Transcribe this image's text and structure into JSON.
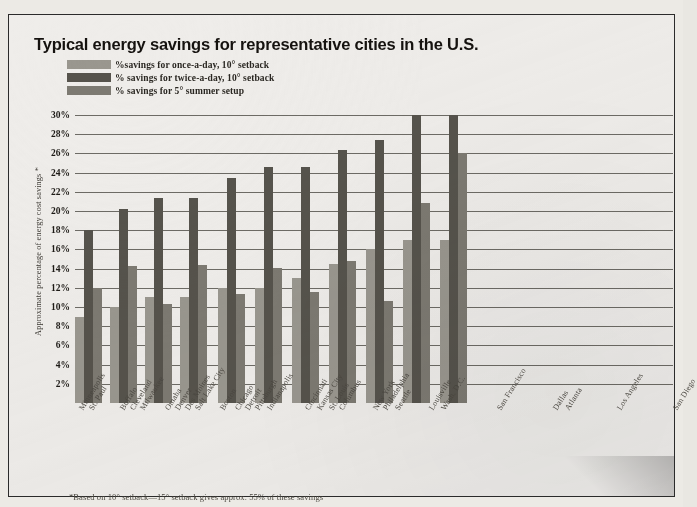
{
  "title": "Typical energy savings for representative cities in the U.S.",
  "footnote": "*Based on 10° setback—15° setback gives approx. 55% of these savings",
  "ylabel": "Approximate percentage of energy cost savings *",
  "legend": [
    {
      "label": "%savings for once-a-day, 10° setback",
      "color": "#9a978f"
    },
    {
      "label": "% savings for twice-a-day, 10° setback",
      "color": "#56534c"
    },
    {
      "label": "% savings for 5° summer setup",
      "color": "#7d7a72"
    }
  ],
  "colors": {
    "series1": "#9a978f",
    "series2": "#56534c",
    "series3": "#7d7a72",
    "grid": "#56534d",
    "text": "#1d1a16",
    "paper": "#efedea",
    "frame": "#2b2b2b"
  },
  "chart_data": {
    "type": "bar",
    "title": "Typical energy savings for representative cities in the U.S.",
    "xlabel": "",
    "ylabel": "Approximate percentage of energy cost savings *",
    "ylim": [
      0,
      30
    ],
    "ytick_labels": [
      "30%",
      "28%",
      "26%",
      "24%",
      "22%",
      "20%",
      "18%",
      "16%",
      "14%",
      "12%",
      "10%",
      "8%",
      "6%",
      "4%",
      "2%"
    ],
    "ytick_values": [
      30,
      28,
      26,
      24,
      22,
      20,
      18,
      16,
      14,
      12,
      10,
      8,
      6,
      4,
      2
    ],
    "grid": true,
    "legend_position": "top-left",
    "groups": [
      {
        "cities": [
          "Minneapolis",
          "St. Paul"
        ]
      },
      {
        "cities": [
          "Buffalo",
          "Cleveland",
          "Milwaukee"
        ]
      },
      {
        "cities": [
          "Omaha",
          "Denver",
          "Des Moines",
          "Salt Lake City"
        ]
      },
      {
        "cities": [
          "Boston",
          "Chicago",
          "Detroit",
          "Pittsburgh",
          "Indianapolis"
        ]
      },
      {
        "cities": [
          "Cincinnati",
          "Kansas City",
          "St. Louis",
          "Columbus"
        ]
      },
      {
        "cities": [
          "New York",
          "Philadelphia",
          "Seattle"
        ]
      },
      {
        "cities": [
          "Louisville",
          "Wash. D.C."
        ]
      },
      {
        "cities": [
          "San Francisco"
        ]
      },
      {
        "cities": [
          "Dallas",
          "Atlanta"
        ]
      },
      {
        "cities": [
          "Los Angeles"
        ]
      },
      {
        "cities": [
          "San Diego"
        ]
      }
    ],
    "categories": [
      "Minneapolis / St. Paul",
      "Buffalo / Cleveland / Milwaukee",
      "Omaha / Denver / Des Moines / Salt Lake City",
      "Boston / Chicago / Detroit / Pittsburgh / Indianapolis",
      "Cincinnati / Kansas City / St. Louis / Columbus",
      "New York / Philadelphia / Seattle",
      "Louisville / Wash. D.C.",
      "San Francisco",
      "Dallas / Atlanta",
      "Los Angeles",
      "San Diego"
    ],
    "series": [
      {
        "name": "% savings for once-a-day, 10° setback",
        "color": "#9a978f",
        "values": [
          9,
          10,
          11,
          11,
          12,
          12,
          13,
          14.5,
          16,
          17,
          17
        ]
      },
      {
        "name": "% savings for twice-a-day, 10° setback",
        "color": "#56534c",
        "values": [
          18,
          20.2,
          21.4,
          21.4,
          23.4,
          24.6,
          24.6,
          26.4,
          27.4,
          30,
          30
        ]
      },
      {
        "name": "% savings for 5° summer setup",
        "color": "#7d7a72",
        "values": [
          12,
          14.3,
          10.3,
          14.4,
          11.4,
          14.1,
          11.6,
          14.8,
          10.6,
          20.8,
          26
        ]
      }
    ]
  },
  "xaxis_labels": [
    {
      "text": "Minneapolis",
      "pos": 1.5
    },
    {
      "text": "St. Paul",
      "pos": 11.5
    },
    {
      "text": "Buffalo",
      "pos": 43
    },
    {
      "text": "Cleveland",
      "pos": 53
    },
    {
      "text": "Milwaukee",
      "pos": 63
    },
    {
      "text": "Omaha",
      "pos": 88
    },
    {
      "text": "Denver",
      "pos": 98
    },
    {
      "text": "Des Moines",
      "pos": 108
    },
    {
      "text": "Salt Lake City",
      "pos": 118
    },
    {
      "text": "Boston",
      "pos": 143
    },
    {
      "text": "Chicago",
      "pos": 158
    },
    {
      "text": "Detroit",
      "pos": 168
    },
    {
      "text": "Pittsburgh",
      "pos": 178
    },
    {
      "text": "Indianapolis",
      "pos": 190
    },
    {
      "text": "Cincinnati",
      "pos": 228
    },
    {
      "text": "Kansas City",
      "pos": 240
    },
    {
      "text": "St. Louis",
      "pos": 252
    },
    {
      "text": "Columbus",
      "pos": 262
    },
    {
      "text": "New York",
      "pos": 296
    },
    {
      "text": "Philadelphia",
      "pos": 306
    },
    {
      "text": "Seattle",
      "pos": 318
    },
    {
      "text": "Louisville",
      "pos": 352
    },
    {
      "text": "Wash. D.C.",
      "pos": 364
    },
    {
      "text": "San Francisco",
      "pos": 420
    },
    {
      "text": "Dallas",
      "pos": 476
    },
    {
      "text": "Atlanta",
      "pos": 488
    },
    {
      "text": "Los Angeles",
      "pos": 540
    },
    {
      "text": "San Diego",
      "pos": 596
    }
  ]
}
